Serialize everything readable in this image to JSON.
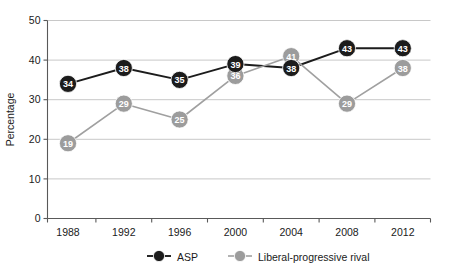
{
  "chart_data": {
    "type": "line",
    "title": "",
    "xlabel": "",
    "ylabel": "Percentage",
    "categories": [
      "1988",
      "1992",
      "1996",
      "2000",
      "2004",
      "2008",
      "2012"
    ],
    "series": [
      {
        "name": "ASP",
        "color": "#1c1c1c",
        "values": [
          34,
          38,
          35,
          39,
          38,
          43,
          43
        ]
      },
      {
        "name": "Liberal-progressive rival",
        "color": "#9c9c9c",
        "values": [
          19,
          29,
          25,
          36,
          41,
          29,
          38
        ]
      }
    ],
    "ylim": [
      0,
      50
    ],
    "yticks": [
      0,
      10,
      20,
      30,
      40,
      50
    ],
    "ytick_labels": [
      "0",
      "10",
      "20",
      "30",
      "40",
      "50"
    ],
    "grid": true,
    "grid_axis": "y",
    "legend_position": "bottom",
    "data_labels": true
  },
  "legend": {
    "items": [
      {
        "label": "ASP",
        "color": "#1c1c1c"
      },
      {
        "label": "Liberal-progressive rival",
        "color": "#9c9c9c"
      }
    ]
  },
  "colors": {
    "axis": "#595959",
    "grid": "#c8c8c8",
    "text": "#1a1a1a",
    "series_dark": "#1c1c1c",
    "series_light": "#9c9c9c",
    "background": "#ffffff"
  }
}
